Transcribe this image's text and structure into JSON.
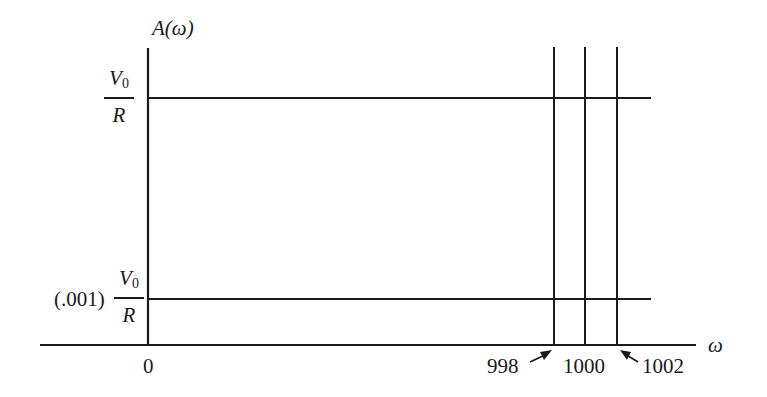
{
  "diagram": {
    "y_axis_label": "A(ω)",
    "x_axis_label": "ω",
    "y_levels": [
      {
        "label_prefix": "",
        "numerator": "V",
        "numerator_sub": "0",
        "denominator": "R",
        "description": "V0/R"
      },
      {
        "label_prefix": "(.001)",
        "numerator": "V",
        "numerator_sub": "0",
        "denominator": "R",
        "description": "(.001) V0/R"
      }
    ],
    "x_ticks": {
      "origin": "0",
      "left": "998",
      "center": "1000",
      "right": "1002"
    },
    "colors": {
      "line": "#1a1a1a",
      "background": "#ffffff"
    }
  }
}
